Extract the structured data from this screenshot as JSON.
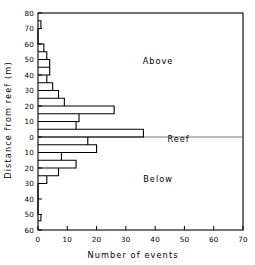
{
  "chart_data": {
    "type": "bar",
    "orientation": "horizontal",
    "title": "",
    "xlabel": "Number of events",
    "ylabel": "Distance from reef (m)",
    "xlim": [
      0,
      70
    ],
    "ylim": [
      -60,
      80
    ],
    "xticks": [
      0,
      10,
      20,
      30,
      40,
      50,
      60,
      70
    ],
    "xtick_labels": [
      "0",
      "10",
      "20",
      "30",
      "40",
      "50",
      "60",
      "70"
    ],
    "yticks": [
      80,
      70,
      60,
      50,
      40,
      30,
      20,
      10,
      0,
      -10,
      -20,
      -30,
      -40,
      -50,
      -60
    ],
    "ytick_labels": [
      "80",
      "70",
      "60",
      "50",
      "40",
      "30",
      "20",
      "10",
      "0",
      "10",
      "20",
      "30",
      "40",
      "50",
      "60"
    ],
    "grid": false,
    "legend": null,
    "reef_line_value": 0,
    "annotations": [
      {
        "text": "Above",
        "x": 41,
        "y": 47
      },
      {
        "text": "Reef",
        "x": 48,
        "y": -3
      },
      {
        "text": "Below",
        "x": 41,
        "y": -29
      }
    ],
    "bin_width": 5,
    "bins": [
      {
        "y_low": 70,
        "y_high": 75,
        "value": 1
      },
      {
        "y_low": 55,
        "y_high": 60,
        "value": 2
      },
      {
        "y_low": 50,
        "y_high": 55,
        "value": 3
      },
      {
        "y_low": 45,
        "y_high": 50,
        "value": 4
      },
      {
        "y_low": 40,
        "y_high": 45,
        "value": 4
      },
      {
        "y_low": 35,
        "y_high": 40,
        "value": 3
      },
      {
        "y_low": 30,
        "y_high": 35,
        "value": 5
      },
      {
        "y_low": 25,
        "y_high": 30,
        "value": 7
      },
      {
        "y_low": 20,
        "y_high": 25,
        "value": 9
      },
      {
        "y_low": 15,
        "y_high": 20,
        "value": 26
      },
      {
        "y_low": 10,
        "y_high": 15,
        "value": 14
      },
      {
        "y_low": 5,
        "y_high": 10,
        "value": 13
      },
      {
        "y_low": 0,
        "y_high": 5,
        "value": 36
      },
      {
        "y_low": -5,
        "y_high": 0,
        "value": 17
      },
      {
        "y_low": -10,
        "y_high": -5,
        "value": 20
      },
      {
        "y_low": -15,
        "y_high": -10,
        "value": 8
      },
      {
        "y_low": -20,
        "y_high": -15,
        "value": 13
      },
      {
        "y_low": -25,
        "y_high": -20,
        "value": 7
      },
      {
        "y_low": -30,
        "y_high": -25,
        "value": 3
      },
      {
        "y_low": -54,
        "y_high": -50,
        "value": 1
      }
    ],
    "colors": {
      "line": "#000000",
      "axis": "#000000",
      "reef_line": "#666666",
      "background": "#ffffff"
    }
  }
}
